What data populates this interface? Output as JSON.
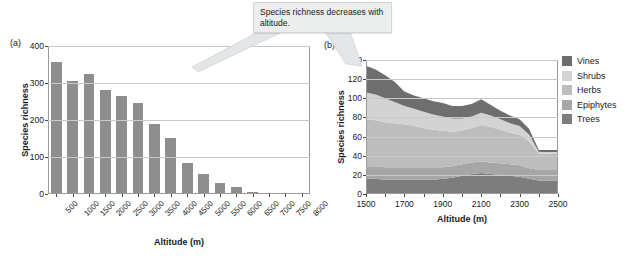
{
  "callout": {
    "text": "Species richness decreases with altitude."
  },
  "legend": {
    "position": "right",
    "items": [
      {
        "label": "Vines",
        "color": "#6e6e6e"
      },
      {
        "label": "Shrubs",
        "color": "#d3d3d3"
      },
      {
        "label": "Herbs",
        "color": "#bdbdbd"
      },
      {
        "label": "Epiphytes",
        "color": "#a6a6a6"
      },
      {
        "label": "Trees",
        "color": "#7d7d7d"
      }
    ]
  },
  "chart_data": [
    {
      "id": "a",
      "panel_label": "(a)",
      "type": "bar",
      "title": "",
      "xlabel": "Altitude (m)",
      "ylabel": "Species richness",
      "categories": [
        "500",
        "1000",
        "1500",
        "2000",
        "2500",
        "3000",
        "3500",
        "4000",
        "4500",
        "5000",
        "5500",
        "6000",
        "6500",
        "7000",
        "7500",
        "8000"
      ],
      "values": [
        358,
        305,
        325,
        282,
        265,
        247,
        188,
        152,
        83,
        54,
        30,
        19,
        6,
        4,
        3,
        0
      ],
      "ylim": [
        0,
        400
      ],
      "yticks": [
        0,
        100,
        200,
        300,
        400
      ],
      "grid": true,
      "bar_color": "#8e8e8e"
    },
    {
      "id": "b",
      "panel_label": "(b)",
      "type": "area",
      "stacked": true,
      "title": "",
      "xlabel": "Altitude (m)",
      "ylabel": "Species richness",
      "xlim": [
        1500,
        2500
      ],
      "xticks": [
        1500,
        1700,
        1900,
        2100,
        2300,
        2500
      ],
      "ylim": [
        0,
        140
      ],
      "yticks": [
        0,
        20,
        40,
        60,
        80,
        100,
        120,
        140
      ],
      "grid": true,
      "x": [
        1500,
        1550,
        1600,
        1650,
        1700,
        1750,
        1800,
        1850,
        1900,
        1950,
        2000,
        2050,
        2100,
        2150,
        2200,
        2250,
        2300,
        2350,
        2400,
        2450,
        2500
      ],
      "series": [
        {
          "name": "Trees",
          "color": "#7d7d7d",
          "values": [
            16,
            16,
            15,
            15,
            15,
            15,
            15,
            15,
            16,
            17,
            19,
            21,
            22,
            21,
            20,
            19,
            18,
            16,
            14,
            14,
            14
          ]
        },
        {
          "name": "Epiphytes",
          "color": "#a6a6a6",
          "values": [
            13,
            13,
            13,
            13,
            13,
            13,
            13,
            13,
            12,
            12,
            12,
            12,
            12,
            12,
            12,
            12,
            12,
            11,
            11,
            11,
            11
          ]
        },
        {
          "name": "Herbs",
          "color": "#bdbdbd",
          "values": [
            49,
            48,
            47,
            46,
            45,
            43,
            41,
            39,
            38,
            36,
            35,
            36,
            38,
            37,
            35,
            33,
            32,
            28,
            17,
            17,
            17
          ]
        },
        {
          "name": "Shrubs",
          "color": "#d3d3d3",
          "values": [
            28,
            27,
            25,
            22,
            19,
            18,
            17,
            16,
            15,
            14,
            13,
            12,
            13,
            12,
            11,
            10,
            9,
            7,
            2,
            2,
            2
          ]
        },
        {
          "name": "Vines",
          "color": "#6e6e6e",
          "values": [
            28,
            26,
            24,
            21,
            15,
            14,
            14,
            14,
            14,
            13,
            13,
            13,
            14,
            11,
            9,
            8,
            7,
            6,
            2,
            2,
            2
          ]
        }
      ],
      "totals": [
        134,
        130,
        124,
        117,
        107,
        103,
        100,
        97,
        95,
        92,
        92,
        94,
        99,
        93,
        87,
        82,
        78,
        68,
        46,
        46,
        46
      ]
    }
  ]
}
